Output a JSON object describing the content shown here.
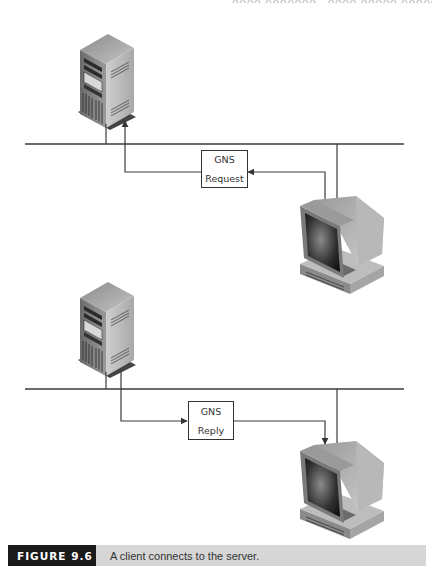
{
  "header": {
    "running_text": "XXXX XXXXXXX · XXXX XXXXX XXXXX XXXXXX"
  },
  "panels": [
    {
      "id": "request",
      "server": {
        "icon": "server-tower-icon"
      },
      "client": {
        "icon": "crt-workstation-icon"
      },
      "message": {
        "line1": "GNS",
        "line2": "Request",
        "direction": "client-to-server"
      }
    },
    {
      "id": "reply",
      "server": {
        "icon": "server-tower-icon"
      },
      "client": {
        "icon": "crt-workstation-icon"
      },
      "message": {
        "line1": "GNS",
        "line2": "Reply",
        "direction": "server-to-client"
      }
    }
  ],
  "caption": {
    "figure_label": "FIGURE 9.6",
    "text": "A client connects to the server."
  },
  "colors": {
    "line": "#3a3a3a",
    "caption_bg": "#d6d6d6",
    "figure_label_bg": "#1a1a1a"
  }
}
